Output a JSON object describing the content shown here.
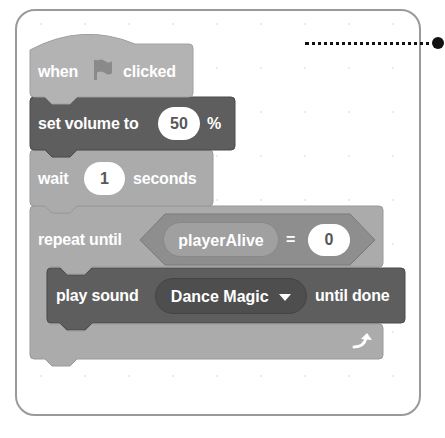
{
  "colors": {
    "events_block": "#b3b3b3",
    "sound_block": "#5e5e5e",
    "sound_dropdown": "#4e4e4e",
    "control_block": "#ababab",
    "operator_block": "#8e8e8e",
    "variable_reporter": "#a0a0a0",
    "card_border": "#9a9a9a",
    "connector": "#111111"
  },
  "script": {
    "hat_block": {
      "label_before": "when",
      "icon": "green-flag-icon",
      "label_after": "clicked"
    },
    "set_volume_block": {
      "label": "set volume to",
      "value": "50",
      "unit": "%"
    },
    "wait_block": {
      "label": "wait",
      "value": "1",
      "unit": "seconds"
    },
    "repeat_until_block": {
      "label": "repeat until",
      "condition": {
        "variable": "playerAlive",
        "operator": "=",
        "value": "0"
      },
      "loop_icon": "repeat-arrow-icon",
      "body": [
        {
          "label": "play sound",
          "sound": "Dance Magic",
          "dropdown_icon": "dropdown-arrow-icon",
          "suffix": "until done"
        }
      ]
    }
  },
  "annotation": {
    "connector": "dotted-leader-line"
  }
}
